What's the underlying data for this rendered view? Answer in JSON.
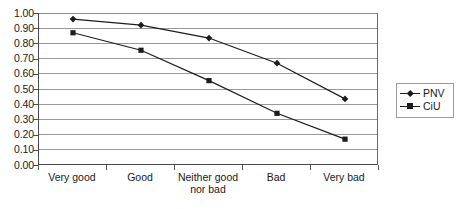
{
  "chart_data": {
    "type": "line",
    "title": "",
    "xlabel": "",
    "ylabel": "",
    "categories": [
      "Very good",
      "Good",
      "Neither good\nnor bad",
      "Bad",
      "Very bad"
    ],
    "series": [
      {
        "name": "PNV",
        "marker": "diamond",
        "values": [
          0.96,
          0.92,
          0.835,
          0.67,
          0.435
        ]
      },
      {
        "name": "CiU",
        "marker": "square",
        "values": [
          0.87,
          0.755,
          0.555,
          0.34,
          0.17
        ]
      }
    ],
    "ylim": [
      0.0,
      1.0
    ],
    "ytick_step": 0.1,
    "ytick_labels": [
      "1.00",
      "0.90",
      "0.80",
      "0.70",
      "0.60",
      "0.50",
      "0.40",
      "0.30",
      "0.20",
      "0.10",
      "0.00"
    ],
    "grid": true,
    "grid_axis": "y",
    "legend_position": "right",
    "colors": {
      "series_line": "#1c1c1c",
      "gridline": "#9a9a9a",
      "axis": "#4a4a4a",
      "text": "#1a1a1a",
      "background": "#ffffff"
    }
  }
}
